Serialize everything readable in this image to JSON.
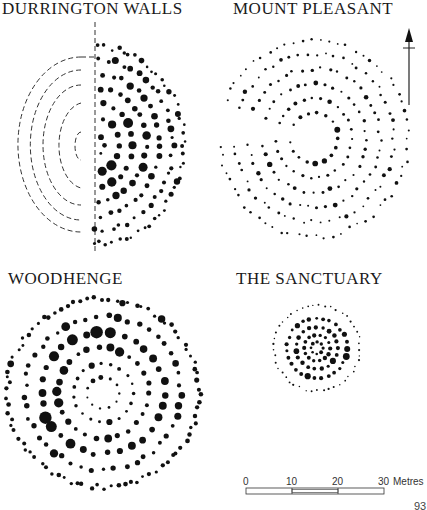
{
  "figure": {
    "panels": [
      {
        "id": "durrington",
        "title": "DURRINGTON WALLS"
      },
      {
        "id": "mount-pleasant",
        "title": "MOUNT PLEASANT"
      },
      {
        "id": "woodhenge",
        "title": "WOODHENGE"
      },
      {
        "id": "sanctuary",
        "title": "THE SANCTUARY"
      }
    ],
    "north_arrow": {
      "icon": "north-arrow-icon"
    },
    "scale_bar": {
      "ticks": [
        "0",
        "10",
        "20",
        "30"
      ],
      "unit": "Metres"
    },
    "page_number": "93"
  }
}
